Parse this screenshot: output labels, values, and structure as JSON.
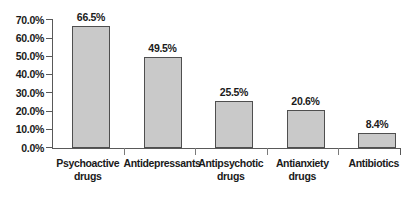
{
  "chart_data": {
    "type": "bar",
    "title": "",
    "subtitle": "",
    "xlabel": "",
    "ylabel": "",
    "ylim": [
      0,
      70
    ],
    "grid": false,
    "legend": false,
    "legend_position": "none",
    "orientation": "vertical",
    "value_format": "percent",
    "categories": [
      "Psychoactive\ndrugs",
      "Antidepressants",
      "Antipsychotic\ndrugs",
      "Antianxiety\ndrugs",
      "Antibiotics"
    ],
    "values": [
      66.5,
      49.5,
      25.5,
      20.6,
      8.4
    ],
    "data_labels": [
      "66.5%",
      "49.5%",
      "25.5%",
      "20.6%",
      "8.4%"
    ],
    "y_ticks": [
      0,
      10,
      20,
      30,
      40,
      50,
      60,
      70
    ],
    "y_tick_labels": [
      "0.0%",
      "10.0%",
      "20.0%",
      "30.0%",
      "40.0%",
      "50.0%",
      "60.0%",
      "70.0%"
    ],
    "colors": {
      "bar_fill": "#c9c9c9",
      "bar_outline": "#4f4f4f",
      "axis": "#595959",
      "text": "#1a1a1a",
      "background": "#ffffff"
    }
  }
}
